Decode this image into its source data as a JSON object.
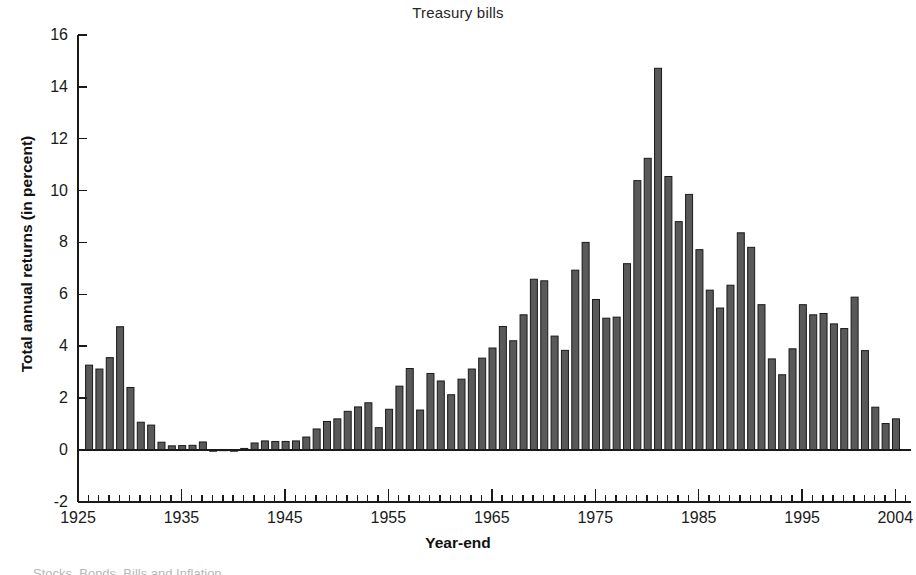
{
  "chart_data": {
    "type": "bar",
    "title": "Treasury bills",
    "xlabel": "Year-end",
    "ylabel": "Total annual returns (in percent)",
    "grid": false,
    "legend": "none",
    "xlim": [
      1925,
      2005
    ],
    "ylim": [
      -2,
      16
    ],
    "ytick_labels": [
      "16",
      "14",
      "12",
      "10",
      "8",
      "6",
      "4",
      "2",
      "0",
      "-2"
    ],
    "ytick_values": [
      16,
      14,
      12,
      10,
      8,
      6,
      4,
      2,
      0,
      -2
    ],
    "xtick_labels": [
      "1925",
      "1935",
      "1945",
      "1955",
      "1965",
      "1975",
      "1985",
      "1995",
      "2004"
    ],
    "xtick_values": [
      1925,
      1935,
      1945,
      1955,
      1965,
      1975,
      1985,
      1995,
      2004
    ],
    "minor_tick_interval": 1,
    "bar_color": "#595959",
    "bar_edge_color": "#1a1a1a",
    "categories": [
      1926,
      1927,
      1928,
      1929,
      1930,
      1931,
      1932,
      1933,
      1934,
      1935,
      1936,
      1937,
      1938,
      1939,
      1940,
      1941,
      1942,
      1943,
      1944,
      1945,
      1946,
      1947,
      1948,
      1949,
      1950,
      1951,
      1952,
      1953,
      1954,
      1955,
      1956,
      1957,
      1958,
      1959,
      1960,
      1961,
      1962,
      1963,
      1964,
      1965,
      1966,
      1967,
      1968,
      1969,
      1970,
      1971,
      1972,
      1973,
      1974,
      1975,
      1976,
      1977,
      1978,
      1979,
      1980,
      1981,
      1982,
      1983,
      1984,
      1985,
      1986,
      1987,
      1988,
      1989,
      1990,
      1991,
      1992,
      1993,
      1994,
      1995,
      1996,
      1997,
      1998,
      1999,
      2000,
      2001,
      2002,
      2003,
      2004
    ],
    "values": [
      3.27,
      3.12,
      3.56,
      4.75,
      2.41,
      1.07,
      0.96,
      0.3,
      0.16,
      0.17,
      0.18,
      0.31,
      -0.02,
      0.02,
      0.0,
      0.06,
      0.27,
      0.35,
      0.33,
      0.33,
      0.35,
      0.5,
      0.81,
      1.1,
      1.2,
      1.49,
      1.66,
      1.82,
      0.86,
      1.57,
      2.46,
      3.14,
      1.54,
      2.95,
      2.66,
      2.13,
      2.73,
      3.12,
      3.54,
      3.93,
      4.76,
      4.21,
      5.21,
      6.58,
      6.52,
      4.39,
      3.84,
      6.93,
      8.0,
      5.8,
      5.08,
      5.12,
      7.18,
      10.38,
      11.24,
      14.71,
      10.54,
      8.8,
      9.85,
      7.72,
      6.16,
      5.47,
      6.35,
      8.37,
      7.81,
      5.6,
      3.51,
      2.9,
      3.9,
      5.6,
      5.21,
      5.26,
      4.86,
      4.68,
      5.89,
      3.83,
      1.65,
      1.02,
      1.2
    ]
  },
  "footer": {
    "cropped_text": "Stocks, Bonds, Bills and Inflation"
  }
}
